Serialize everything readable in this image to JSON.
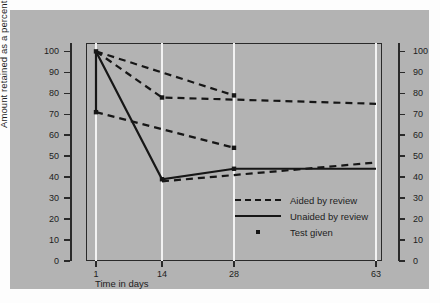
{
  "chart_data": {
    "type": "line",
    "title": "",
    "xlabel": "Time in days",
    "ylabel": "Amount retained as a percentage of amount learned",
    "x_ticks": [
      1,
      14,
      28,
      63
    ],
    "x_tick_labels": [
      "1",
      "14",
      "28",
      "63"
    ],
    "y_ticks": [
      0,
      10,
      20,
      30,
      40,
      50,
      60,
      70,
      80,
      90,
      100
    ],
    "y_tick_labels": [
      "0",
      "10",
      "20",
      "30",
      "40",
      "50",
      "60",
      "70",
      "80",
      "90",
      "100"
    ],
    "ylim": [
      0,
      104
    ],
    "xlim_days": [
      1,
      63
    ],
    "grid": "vertical white gridlines at each x tick",
    "legend_position": "inside lower right",
    "legend": [
      {
        "label": "Aided by review",
        "style": "dashed"
      },
      {
        "label": "Unaided by review",
        "style": "solid"
      },
      {
        "label": "Test given",
        "style": "dot-marker"
      }
    ],
    "series": [
      {
        "name": "Aided by review (upper)",
        "style": "dashed",
        "x": [
          1,
          14,
          28,
          63
        ],
        "values": [
          100,
          78,
          77,
          75
        ]
      },
      {
        "name": "Aided by review (test at 28)",
        "style": "dashed",
        "x": [
          1,
          28
        ],
        "values": [
          100,
          79
        ]
      },
      {
        "name": "Aided by review (lower)",
        "style": "dashed",
        "x": [
          1,
          28
        ],
        "values": [
          71,
          54
        ]
      },
      {
        "name": "Aided by review (lower continuation)",
        "style": "dashed",
        "x": [
          14,
          28,
          63
        ],
        "values": [
          38,
          41,
          47
        ]
      },
      {
        "name": "Unaided by review",
        "style": "solid",
        "x": [
          1,
          14,
          28,
          63
        ],
        "values": [
          100,
          39,
          44,
          44
        ]
      },
      {
        "name": "Unaided by review (initial drop)",
        "style": "solid",
        "x": [
          1,
          1
        ],
        "values": [
          100,
          71
        ]
      }
    ],
    "test_given_points": [
      {
        "x": 1,
        "value": 100
      },
      {
        "x": 1,
        "value": 71
      },
      {
        "x": 14,
        "value": 78
      },
      {
        "x": 14,
        "value": 39
      },
      {
        "x": 28,
        "value": 79
      },
      {
        "x": 28,
        "value": 54
      },
      {
        "x": 28,
        "value": 44
      }
    ],
    "colors": {
      "panel_background": "#b3b3b3",
      "line": "#161616",
      "gridline": "#f2f2f2",
      "axis": "#2a2a2a",
      "text": "#1d1d1d"
    }
  }
}
